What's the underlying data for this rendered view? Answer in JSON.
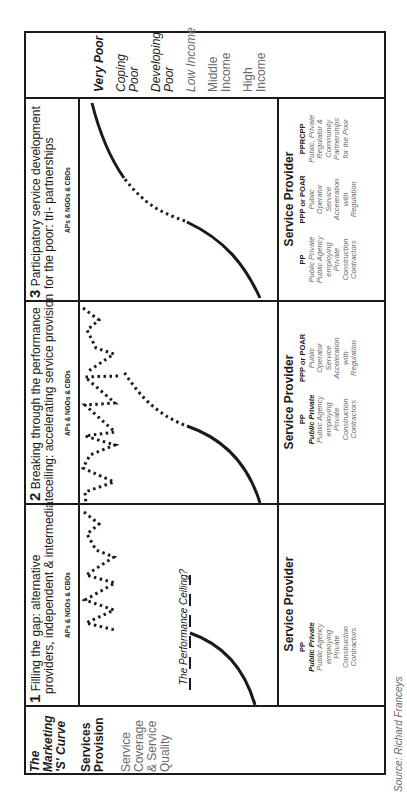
{
  "header_row": {
    "income_levels": [
      {
        "label": "Very Poor",
        "style": "bold-italic"
      },
      {
        "label": "Coping Poor",
        "style": "italic"
      },
      {
        "label": "Developing Poor",
        "style": "italic"
      },
      {
        "label": "Low Income",
        "style": "grey-italic"
      },
      {
        "label": "Middle Income",
        "style": "grey"
      },
      {
        "label": "High Income",
        "style": "grey"
      }
    ]
  },
  "legend_row": {
    "title": "The Marketing 'S' Curve",
    "services_provision": "Services Provision",
    "coverage_quality": "Service Coverage & Service Quality"
  },
  "panels": [
    {
      "number": "3",
      "title_line1": "Participatory service development",
      "title_line2": "for the poor: tri- partnerships",
      "actors": "APs & NGOs & CBOs",
      "provider_heading": "Service Provider",
      "providers": [
        {
          "code": "PP",
          "lines": [
            "Public Private",
            "Public Agency",
            "employing",
            "Private",
            "Construction",
            "Contractors"
          ]
        },
        {
          "code": "PPP or POAR",
          "lines": [
            "Public",
            "Operator",
            "Service",
            "Acceleration",
            "with",
            "Regulation"
          ]
        },
        {
          "code": "PPRCPP",
          "lines": [
            "Public, Private",
            "Regulator &",
            "Community",
            "Partnerships",
            "for the Poor"
          ]
        }
      ]
    },
    {
      "number": "2",
      "title_line1": "Breaking through the performance",
      "title_line2": "ceiling: accelerating service provision",
      "actors": "APs & NGOs & CBOs",
      "provider_heading": "Service Provider",
      "providers": [
        {
          "code": "PP",
          "lines": [
            "Public Private",
            "Public Agency",
            "employing",
            "Private",
            "Construction",
            "Contractors"
          ]
        },
        {
          "code": "PPP or POAR",
          "lines": [
            "Public",
            "Operator",
            "Service",
            "Acceleration",
            "with",
            "Regulation"
          ]
        }
      ]
    },
    {
      "number": "1",
      "title_line1": "Filling the gap: alternative",
      "title_line2": "providers, independent & intermediate",
      "actors": "APs & NGOs & CBOs",
      "ceiling_label": "The Performance Ceiling?",
      "provider_heading": "Service Provider",
      "providers": [
        {
          "code": "PP",
          "lines": [
            "Public Private",
            "Public Agency",
            "employing",
            "Private",
            "Construction",
            "Contractors"
          ]
        }
      ]
    }
  ],
  "source": "Source: Richard Franceys",
  "colors": {
    "line": "#1a1a1a",
    "grey_text": "#6a6a6a",
    "background": "#ffffff"
  }
}
